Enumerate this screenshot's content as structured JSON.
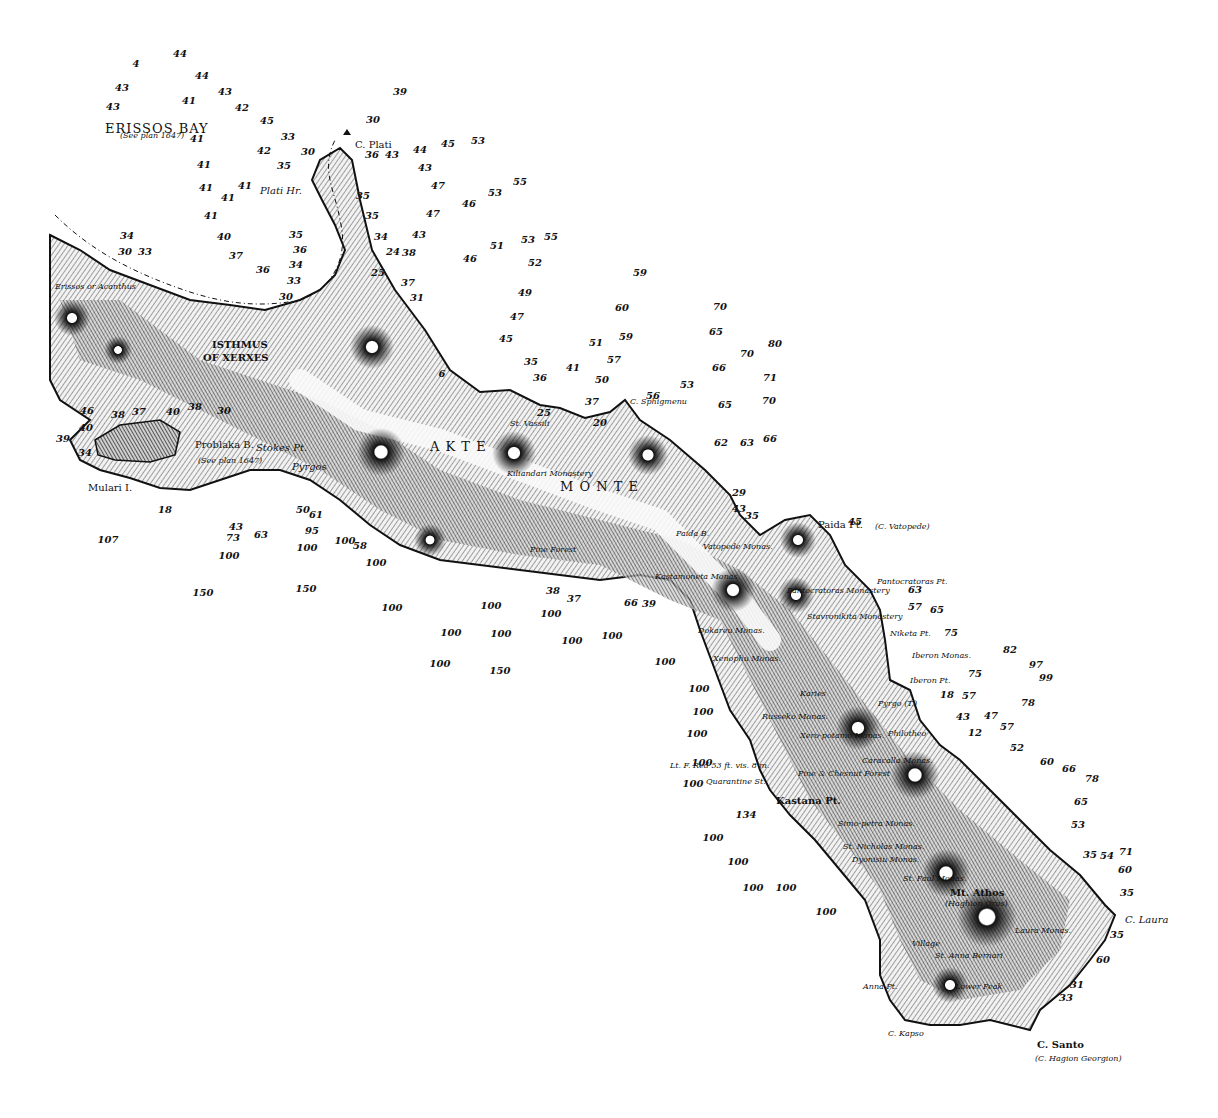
{
  "chart": {
    "title_region": "Akte / Monte Santo peninsula (Mt. Athos)",
    "colors": {
      "ink": "#111111",
      "paper": "#ffffff",
      "land_shade": "#555555"
    }
  },
  "places": [
    {
      "id": "erissos_bay",
      "text": "ERISSOS BAY",
      "x": 105,
      "y": 122,
      "cls": "big"
    },
    {
      "id": "erissos_bay_note",
      "text": "(See plan 1647)",
      "x": 120,
      "y": 132,
      "cls": "tiny"
    },
    {
      "id": "c_plati",
      "text": "C. Plati",
      "x": 355,
      "y": 140,
      "cls": ""
    },
    {
      "id": "plati_hr",
      "text": "Plati Hr.",
      "x": 260,
      "y": 186,
      "cls": "ital"
    },
    {
      "id": "erissos",
      "text": "Erissos or Acanthus",
      "x": 55,
      "y": 283,
      "cls": "tiny"
    },
    {
      "id": "isthmus",
      "text": "ISTHMUS",
      "x": 212,
      "y": 340,
      "cls": "cap"
    },
    {
      "id": "of_xerxes",
      "text": "OF XERXES",
      "x": 203,
      "y": 353,
      "cls": "cap"
    },
    {
      "id": "problaka",
      "text": "Problaka B.",
      "x": 195,
      "y": 440,
      "cls": ""
    },
    {
      "id": "problaka_note",
      "text": "(See plan 1647)",
      "x": 198,
      "y": 457,
      "cls": "tiny"
    },
    {
      "id": "mulari",
      "text": "Mulari I.",
      "x": 88,
      "y": 483,
      "cls": ""
    },
    {
      "id": "stokes",
      "text": "Stokes Pt.",
      "x": 256,
      "y": 443,
      "cls": "ital"
    },
    {
      "id": "pyrgos",
      "text": "Pyrgos",
      "x": 292,
      "y": 462,
      "cls": "ital"
    },
    {
      "id": "akte",
      "text": "A K T E",
      "x": 430,
      "y": 440,
      "cls": "big"
    },
    {
      "id": "monte",
      "text": "M O N T E",
      "x": 560,
      "y": 480,
      "cls": "big"
    },
    {
      "id": "st_vassili",
      "text": "St. Vassili",
      "x": 510,
      "y": 420,
      "cls": "tiny"
    },
    {
      "id": "kilantaru",
      "text": "Kiliandari Monastery",
      "x": 507,
      "y": 470,
      "cls": "tiny"
    },
    {
      "id": "c_sphigmenu",
      "text": "C. Sphigmenu",
      "x": 630,
      "y": 398,
      "cls": "tiny"
    },
    {
      "id": "pine_forest",
      "text": "Pine Forest",
      "x": 530,
      "y": 546,
      "cls": "tiny"
    },
    {
      "id": "paida_b",
      "text": "Paida B.",
      "x": 676,
      "y": 530,
      "cls": "tiny"
    },
    {
      "id": "paida_pt",
      "text": "Paida Pt.",
      "x": 818,
      "y": 520,
      "cls": ""
    },
    {
      "id": "c_vatopede",
      "text": "(C. Vatopede)",
      "x": 875,
      "y": 523,
      "cls": "tiny"
    },
    {
      "id": "vatopede",
      "text": "Vatopede Monas.",
      "x": 703,
      "y": 543,
      "cls": "tiny"
    },
    {
      "id": "kastamoneta",
      "text": "Kastamoneta Monas.",
      "x": 655,
      "y": 573,
      "cls": "tiny"
    },
    {
      "id": "pantocratoras_pt",
      "text": "Pantocratoras Pt.",
      "x": 877,
      "y": 578,
      "cls": "tiny"
    },
    {
      "id": "pantocratoras_mon",
      "text": "Pantocratoras Monastery",
      "x": 787,
      "y": 587,
      "cls": "tiny"
    },
    {
      "id": "stavronikita",
      "text": "Stavronikita Monastery",
      "x": 807,
      "y": 613,
      "cls": "tiny"
    },
    {
      "id": "dokareu",
      "text": "Dokareu Monas.",
      "x": 698,
      "y": 627,
      "cls": "tiny"
    },
    {
      "id": "niketa",
      "text": "Niketa Pt.",
      "x": 890,
      "y": 630,
      "cls": "tiny"
    },
    {
      "id": "iberon_mon",
      "text": "Iberon Monas.",
      "x": 912,
      "y": 652,
      "cls": "tiny"
    },
    {
      "id": "iberon_pt",
      "text": "Iberon Pt.",
      "x": 910,
      "y": 677,
      "cls": "tiny"
    },
    {
      "id": "xenophu",
      "text": "Xenophu Monas.",
      "x": 713,
      "y": 655,
      "cls": "tiny"
    },
    {
      "id": "karies",
      "text": "Karies",
      "x": 800,
      "y": 690,
      "cls": "tiny"
    },
    {
      "id": "pyrgo",
      "text": "Pyrgo (T.)",
      "x": 878,
      "y": 700,
      "cls": "tiny"
    },
    {
      "id": "russeko",
      "text": "Russeko Monas.",
      "x": 762,
      "y": 713,
      "cls": "tiny"
    },
    {
      "id": "xero",
      "text": "Xero-potamo Monas.",
      "x": 800,
      "y": 732,
      "cls": "tiny"
    },
    {
      "id": "philotheo",
      "text": "Philotheo",
      "x": 888,
      "y": 730,
      "cls": "tiny"
    },
    {
      "id": "lt_f_red",
      "text": "Lt. F. Red 53 ft. vis. 8 m.",
      "x": 670,
      "y": 762,
      "cls": "tiny"
    },
    {
      "id": "quarantine",
      "text": "Quarantine St.",
      "x": 706,
      "y": 778,
      "cls": "tiny"
    },
    {
      "id": "pine_chesnut",
      "text": "Pine & Chesnut Forest",
      "x": 798,
      "y": 770,
      "cls": "tiny"
    },
    {
      "id": "caracalla",
      "text": "Caracalla Monas.",
      "x": 862,
      "y": 757,
      "cls": "tiny"
    },
    {
      "id": "kastana",
      "text": "Kastana Pt.",
      "x": 776,
      "y": 796,
      "cls": "cap"
    },
    {
      "id": "simo_petra",
      "text": "Simo-petra Monas.",
      "x": 838,
      "y": 820,
      "cls": "tiny"
    },
    {
      "id": "st_nicholas",
      "text": "St. Nicholas Monas.",
      "x": 843,
      "y": 843,
      "cls": "tiny"
    },
    {
      "id": "dyonisiu",
      "text": "Dyonisiu Monas.",
      "x": 852,
      "y": 856,
      "cls": "tiny"
    },
    {
      "id": "st_paul",
      "text": "St. Paul Monas.",
      "x": 903,
      "y": 875,
      "cls": "tiny"
    },
    {
      "id": "mt_athos",
      "text": "Mt. Athos",
      "x": 950,
      "y": 888,
      "cls": "cap"
    },
    {
      "id": "haghion_oros",
      "text": "(Haghion Oros)",
      "x": 945,
      "y": 900,
      "cls": "tiny"
    },
    {
      "id": "laura_monas",
      "text": "Laura Monas.",
      "x": 1015,
      "y": 927,
      "cls": "tiny"
    },
    {
      "id": "c_laura",
      "text": "C. Laura",
      "x": 1125,
      "y": 915,
      "cls": "ital"
    },
    {
      "id": "village",
      "text": "Village",
      "x": 912,
      "y": 940,
      "cls": "tiny"
    },
    {
      "id": "anna_bernari",
      "text": "St. Anna Bernari",
      "x": 935,
      "y": 952,
      "cls": "tiny"
    },
    {
      "id": "anna_pt",
      "text": "Anna Pt.",
      "x": 863,
      "y": 983,
      "cls": "tiny"
    },
    {
      "id": "lower_peak",
      "text": "Lower Peak",
      "x": 955,
      "y": 983,
      "cls": "tiny"
    },
    {
      "id": "c_kapso",
      "text": "C. Kapso",
      "x": 888,
      "y": 1030,
      "cls": "tiny"
    },
    {
      "id": "c_santo",
      "text": "C. Santo",
      "x": 1037,
      "y": 1040,
      "cls": "cap"
    },
    {
      "id": "c_hagion",
      "text": "(C. Hagion Georgion)",
      "x": 1035,
      "y": 1055,
      "cls": "tiny"
    }
  ],
  "soundings": [
    [
      "4",
      136,
      64
    ],
    [
      "44",
      180,
      54
    ],
    [
      "43",
      122,
      88
    ],
    [
      "44",
      202,
      76
    ],
    [
      "43",
      225,
      92
    ],
    [
      "43",
      113,
      107
    ],
    [
      "41",
      189,
      101
    ],
    [
      "42",
      242,
      108
    ],
    [
      "39",
      400,
      92
    ],
    [
      "30",
      373,
      120
    ],
    [
      "45",
      267,
      121
    ],
    [
      "33",
      288,
      137
    ],
    [
      "41",
      197,
      139
    ],
    [
      "42",
      264,
      151
    ],
    [
      "35",
      284,
      166
    ],
    [
      "30",
      308,
      152
    ],
    [
      "36",
      372,
      155
    ],
    [
      "43",
      392,
      155
    ],
    [
      "44",
      420,
      150
    ],
    [
      "45",
      448,
      144
    ],
    [
      "53",
      478,
      141
    ],
    [
      "43",
      425,
      168
    ],
    [
      "41",
      204,
      165
    ],
    [
      "41",
      206,
      188
    ],
    [
      "41",
      228,
      198
    ],
    [
      "41",
      245,
      186
    ],
    [
      "47",
      438,
      186
    ],
    [
      "35",
      363,
      196
    ],
    [
      "46",
      469,
      204
    ],
    [
      "53",
      495,
      193
    ],
    [
      "55",
      520,
      182
    ],
    [
      "47",
      433,
      214
    ],
    [
      "35",
      372,
      216
    ],
    [
      "41",
      211,
      216
    ],
    [
      "40",
      224,
      237
    ],
    [
      "34",
      127,
      236
    ],
    [
      "30",
      125,
      252
    ],
    [
      "33",
      145,
      252
    ],
    [
      "34",
      381,
      237
    ],
    [
      "24",
      393,
      252
    ],
    [
      "38",
      409,
      253
    ],
    [
      "43",
      419,
      235
    ],
    [
      "46",
      470,
      259
    ],
    [
      "51",
      497,
      246
    ],
    [
      "53",
      528,
      240
    ],
    [
      "55",
      551,
      237
    ],
    [
      "52",
      535,
      263
    ],
    [
      "37",
      236,
      256
    ],
    [
      "36",
      263,
      270
    ],
    [
      "35",
      296,
      235
    ],
    [
      "36",
      300,
      250
    ],
    [
      "34",
      296,
      265
    ],
    [
      "33",
      294,
      281
    ],
    [
      "30",
      286,
      297
    ],
    [
      "25",
      378,
      273
    ],
    [
      "37",
      408,
      283
    ],
    [
      "31",
      417,
      298
    ],
    [
      "49",
      525,
      293
    ],
    [
      "59",
      640,
      273
    ],
    [
      "47",
      517,
      317
    ],
    [
      "60",
      622,
      308
    ],
    [
      "70",
      720,
      307
    ],
    [
      "65",
      716,
      332
    ],
    [
      "59",
      626,
      337
    ],
    [
      "45",
      506,
      339
    ],
    [
      "51",
      596,
      343
    ],
    [
      "57",
      614,
      360
    ],
    [
      "70",
      747,
      354
    ],
    [
      "80",
      775,
      344
    ],
    [
      "66",
      719,
      368
    ],
    [
      "35",
      531,
      362
    ],
    [
      "41",
      573,
      368
    ],
    [
      "50",
      602,
      380
    ],
    [
      "71",
      770,
      378
    ],
    [
      "65",
      725,
      405
    ],
    [
      "70",
      769,
      401
    ],
    [
      "62",
      721,
      443
    ],
    [
      "63",
      747,
      443
    ],
    [
      "66",
      770,
      439
    ],
    [
      "46",
      87,
      411
    ],
    [
      "38",
      118,
      415
    ],
    [
      "37",
      139,
      412
    ],
    [
      "40",
      173,
      412
    ],
    [
      "38",
      195,
      407
    ],
    [
      "30",
      224,
      411
    ],
    [
      "39",
      63,
      439
    ],
    [
      "40",
      86,
      428
    ],
    [
      "34",
      85,
      453
    ],
    [
      "18",
      165,
      510
    ],
    [
      "107",
      108,
      540
    ],
    [
      "43",
      236,
      527
    ],
    [
      "73",
      233,
      538
    ],
    [
      "63",
      261,
      535
    ],
    [
      "100",
      229,
      556
    ],
    [
      "150",
      203,
      593
    ],
    [
      "95",
      312,
      531
    ],
    [
      "100",
      307,
      548
    ],
    [
      "150",
      306,
      589
    ],
    [
      "50",
      303,
      510
    ],
    [
      "61",
      316,
      515
    ],
    [
      "100",
      345,
      541
    ],
    [
      "58",
      360,
      546
    ],
    [
      "100",
      376,
      563
    ],
    [
      "100",
      392,
      608
    ],
    [
      "38",
      553,
      591
    ],
    [
      "66",
      631,
      603
    ],
    [
      "39",
      649,
      604
    ],
    [
      "100",
      491,
      606
    ],
    [
      "100",
      551,
      614
    ],
    [
      "100",
      451,
      633
    ],
    [
      "100",
      501,
      634
    ],
    [
      "100",
      572,
      641
    ],
    [
      "100",
      612,
      636
    ],
    [
      "100",
      440,
      664
    ],
    [
      "150",
      500,
      671
    ],
    [
      "100",
      665,
      662
    ],
    [
      "100",
      699,
      689
    ],
    [
      "100",
      703,
      712
    ],
    [
      "100",
      697,
      734
    ],
    [
      "100",
      702,
      763
    ],
    [
      "100",
      693,
      784
    ],
    [
      "134",
      746,
      815
    ],
    [
      "100",
      713,
      838
    ],
    [
      "100",
      738,
      862
    ],
    [
      "100",
      786,
      888
    ],
    [
      "100",
      753,
      888
    ],
    [
      "100",
      826,
      912
    ],
    [
      "45",
      855,
      522
    ],
    [
      "63",
      915,
      590
    ],
    [
      "57",
      915,
      607
    ],
    [
      "65",
      937,
      610
    ],
    [
      "75",
      951,
      633
    ],
    [
      "82",
      1010,
      650
    ],
    [
      "97",
      1036,
      665
    ],
    [
      "99",
      1046,
      678
    ],
    [
      "75",
      975,
      674
    ],
    [
      "18",
      947,
      695
    ],
    [
      "57",
      969,
      696
    ],
    [
      "78",
      1028,
      703
    ],
    [
      "43",
      963,
      717
    ],
    [
      "47",
      991,
      716
    ],
    [
      "12",
      975,
      733
    ],
    [
      "57",
      1007,
      727
    ],
    [
      "52",
      1017,
      748
    ],
    [
      "60",
      1047,
      762
    ],
    [
      "66",
      1069,
      769
    ],
    [
      "78",
      1092,
      779
    ],
    [
      "65",
      1081,
      802
    ],
    [
      "53",
      1078,
      825
    ],
    [
      "35",
      1090,
      855
    ],
    [
      "54",
      1107,
      856
    ],
    [
      "71",
      1126,
      852
    ],
    [
      "60",
      1125,
      870
    ],
    [
      "35",
      1127,
      893
    ],
    [
      "35",
      1117,
      935
    ],
    [
      "60",
      1103,
      960
    ],
    [
      "31",
      1077,
      985
    ],
    [
      "33",
      1066,
      998
    ],
    [
      "29",
      739,
      493
    ],
    [
      "43",
      739,
      509
    ],
    [
      "35",
      752,
      516
    ],
    [
      "37",
      574,
      599
    ],
    [
      "6",
      442,
      374
    ],
    [
      "36",
      540,
      378
    ],
    [
      "37",
      592,
      402
    ],
    [
      "25",
      544,
      413
    ],
    [
      "20",
      600,
      423
    ],
    [
      "56",
      653,
      396
    ],
    [
      "53",
      687,
      385
    ]
  ]
}
